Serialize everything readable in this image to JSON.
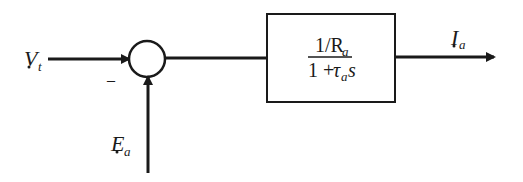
{
  "diagram": {
    "type": "block-diagram",
    "inputs": {
      "vt": {
        "main": "V",
        "sub": "t"
      },
      "ea": {
        "main": "E",
        "sub": "a"
      }
    },
    "summing_junction": {
      "minus_sign": "–"
    },
    "transfer_block": {
      "numerator": {
        "prefix": "1/R",
        "sub": "a"
      },
      "denominator": {
        "prefix": "1 + ",
        "tau": "τ",
        "tau_sub": "a",
        "var": "s"
      }
    },
    "output": {
      "main": "I",
      "sub": "a"
    },
    "colors": {
      "stroke": "#1a1a1a",
      "background": "#ffffff"
    }
  }
}
